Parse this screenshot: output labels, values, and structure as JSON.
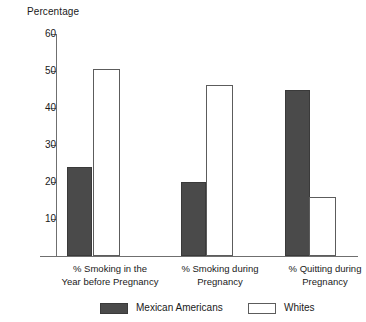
{
  "chart_data": {
    "type": "bar",
    "title": "",
    "subtitle": "",
    "xlabel": "",
    "ylabel": "Percentage",
    "ylim": [
      0,
      60
    ],
    "yticks": [
      60,
      50,
      40,
      30,
      20,
      10
    ],
    "grid": false,
    "legend_position": "bottom",
    "categories": [
      "% Smoking in the\nYear before Pregnancy",
      "% Smoking during\nPregnancy",
      "% Quitting during\nPregnancy"
    ],
    "series": [
      {
        "name": "Mexican Americans",
        "color": "#4a4a4a",
        "values": [
          24.1,
          20.0,
          45.0
        ]
      },
      {
        "name": "Whites",
        "color": "#ffffff",
        "values": [
          50.5,
          46.1,
          16.0
        ]
      }
    ]
  },
  "legend": {
    "items": [
      {
        "label": "Mexican Americans",
        "swatch": "dark"
      },
      {
        "label": "Whites",
        "swatch": "light"
      }
    ]
  },
  "axis": {
    "y_title": "Percentage",
    "tick_labels": [
      "60",
      "50",
      "40",
      "30",
      "20",
      "10"
    ]
  }
}
